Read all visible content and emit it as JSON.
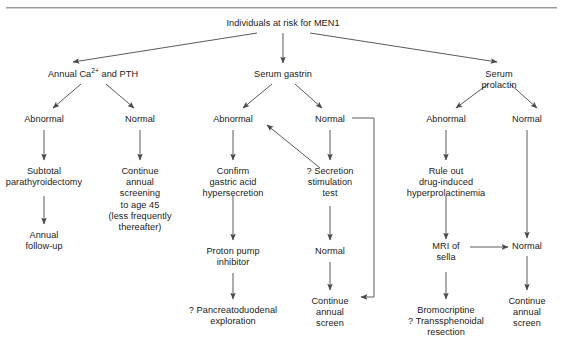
{
  "figure": {
    "type": "flowchart",
    "title_text": "Individuals at risk for MEN1",
    "topic": "MEN1 screening algorithm",
    "rule_color": "#9a9a9a",
    "text_color": "#1a1a1a",
    "line_color": "#555555"
  },
  "nodes": {
    "root": "Individuals at risk for MEN1",
    "branch_calcium": "Annual Ca2+ and PTH",
    "branch_calcium_pre": "Annual Ca",
    "branch_calcium_sup": "2+",
    "branch_calcium_post": " and PTH",
    "branch_gastrin": "Serum gastrin",
    "branch_prolactin": "Serum prolactin",
    "ca_abnormal": "Abnormal",
    "ca_normal": "Normal",
    "ca_abnormal_action": "Subtotal\nparathyroidectomy",
    "ca_abnormal_followup": "Annual\nfollow-up",
    "ca_normal_action": "Continue\nannual\nscreening\nto age 45\n(less frequently\nthereafter)",
    "gastrin_abnormal": "Abnormal",
    "gastrin_normal": "Normal",
    "gastrin_abnormal_action": "Confirm\ngastric acid\nhypersecretion",
    "gastrin_ppi": "Proton pump\ninhibitor",
    "gastrin_surgery": "? Pancreatoduodenal\nexploration",
    "gastrin_secretion_test": "? Secretion\nstimulation\ntest",
    "gastrin_test_normal": "Normal",
    "gastrin_continue": "Continue\nannual\nscreen",
    "prolactin_abnormal": "Abnormal",
    "prolactin_normal": "Normal",
    "prolactin_ruleout": "Rule out\ndrug-induced\nhyperprolactinemia",
    "prolactin_mri": "MRI of\nsella",
    "prolactin_mri_normal": "Normal",
    "prolactin_treatment": "Bromocriptine\n? Transsphenoidal\nresection",
    "prolactin_continue": "Continue\nannual\nscreen"
  },
  "edges": [
    {
      "from": "root",
      "to": "branch_calcium",
      "kind": "diagonal-arrow"
    },
    {
      "from": "root",
      "to": "branch_gastrin",
      "kind": "vertical-arrow"
    },
    {
      "from": "root",
      "to": "branch_prolactin",
      "kind": "diagonal-arrow"
    },
    {
      "from": "branch_calcium",
      "to": "ca_abnormal",
      "kind": "diagonal-arrow"
    },
    {
      "from": "branch_calcium",
      "to": "ca_normal",
      "kind": "diagonal-arrow"
    },
    {
      "from": "ca_abnormal",
      "to": "ca_abnormal_action",
      "kind": "vertical-arrow"
    },
    {
      "from": "ca_abnormal_action",
      "to": "ca_abnormal_followup",
      "kind": "vertical-arrow"
    },
    {
      "from": "ca_normal",
      "to": "ca_normal_action",
      "kind": "vertical-arrow"
    },
    {
      "from": "branch_gastrin",
      "to": "gastrin_abnormal",
      "kind": "diagonal-arrow"
    },
    {
      "from": "branch_gastrin",
      "to": "gastrin_normal",
      "kind": "diagonal-arrow"
    },
    {
      "from": "gastrin_abnormal",
      "to": "gastrin_abnormal_action",
      "kind": "vertical-arrow"
    },
    {
      "from": "gastrin_abnormal_action",
      "to": "gastrin_ppi",
      "kind": "vertical-arrow"
    },
    {
      "from": "gastrin_ppi",
      "to": "gastrin_surgery",
      "kind": "vertical-arrow"
    },
    {
      "from": "gastrin_normal",
      "to": "gastrin_secretion_test",
      "kind": "vertical-arrow"
    },
    {
      "from": "gastrin_secretion_test",
      "to": "gastrin_abnormal",
      "kind": "diagonal-arrow"
    },
    {
      "from": "gastrin_secretion_test",
      "to": "gastrin_test_normal",
      "kind": "vertical-arrow"
    },
    {
      "from": "gastrin_test_normal",
      "to": "gastrin_continue",
      "kind": "vertical-arrow"
    },
    {
      "from": "gastrin_normal",
      "to": "gastrin_continue",
      "kind": "elbow-arrow"
    },
    {
      "from": "branch_prolactin",
      "to": "prolactin_abnormal",
      "kind": "diagonal-arrow"
    },
    {
      "from": "branch_prolactin",
      "to": "prolactin_normal",
      "kind": "diagonal-arrow"
    },
    {
      "from": "prolactin_abnormal",
      "to": "prolactin_ruleout",
      "kind": "vertical-arrow"
    },
    {
      "from": "prolactin_ruleout",
      "to": "prolactin_mri",
      "kind": "vertical-arrow"
    },
    {
      "from": "prolactin_mri",
      "to": "prolactin_mri_normal",
      "kind": "horizontal-arrow"
    },
    {
      "from": "prolactin_mri",
      "to": "prolactin_treatment",
      "kind": "vertical-arrow"
    },
    {
      "from": "prolactin_normal",
      "to": "prolactin_mri_normal",
      "kind": "vertical-line"
    },
    {
      "from": "prolactin_mri_normal",
      "to": "prolactin_continue",
      "kind": "vertical-arrow"
    }
  ]
}
